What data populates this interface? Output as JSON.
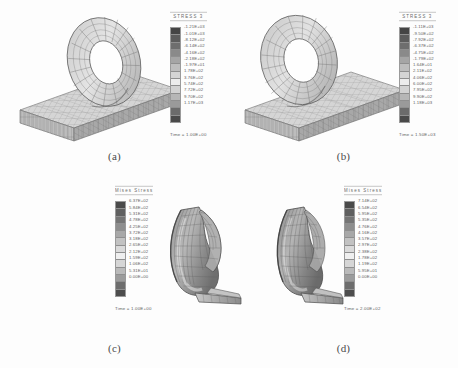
{
  "figure": {
    "panels": [
      {
        "id": "a",
        "caption": "(a)",
        "legend_title": "STRESS 3",
        "time_label": "Time = 1.00E+00",
        "labels": [
          "-1.21E+03",
          "-1.01E+03",
          "-8.12E+02",
          "-6.14E+02",
          "-4.16E+02",
          "-2.18E+02",
          "-1.97E+01",
          "1.78E+02",
          "3.76E+02",
          "5.74E+02",
          "7.72E+02",
          "9.70E+02",
          "1.17E+03"
        ],
        "swatches": [
          "#454545",
          "#5c5c5c",
          "#6e6e6e",
          "#8a8a8a",
          "#a5a5a5",
          "#bdbdbd",
          "#d4d4d4",
          "#ececec",
          "#d2d2d2",
          "#b6b6b6",
          "#9a9a9a",
          "#6b6b6b",
          "#4a4a4a"
        ]
      },
      {
        "id": "b",
        "caption": "(b)",
        "legend_title": "STRESS 3",
        "time_label": "Time = 1.50E+03",
        "labels": [
          "-1.11E+03",
          "-9.50E+02",
          "-7.92E+02",
          "-6.37E+02",
          "-4.75E+02",
          "-1.79E+02",
          "1.64E+01",
          "2.11E+02",
          "4.06E+02",
          "6.00E+02",
          "7.95E+02",
          "9.90E+02",
          "1.18E+03"
        ],
        "swatches": [
          "#454545",
          "#5c5c5c",
          "#6e6e6e",
          "#8a8a8a",
          "#a5a5a5",
          "#bdbdbd",
          "#d4d4d4",
          "#ececec",
          "#d2d2d2",
          "#b6b6b6",
          "#9a9a9a",
          "#6b6b6b",
          "#4a4a4a"
        ]
      },
      {
        "id": "c",
        "caption": "(c)",
        "legend_title": "Mises  Stress",
        "time_label": "Time = 1.00E+00",
        "labels": [
          "6.37E+02",
          "5.84E+02",
          "5.31E+02",
          "4.78E+02",
          "4.25E+02",
          "3.72E+02",
          "3.18E+02",
          "2.65E+02",
          "2.12E+02",
          "1.59E+02",
          "1.06E+02",
          "5.31E+01",
          "0.00E+00"
        ],
        "swatches": [
          "#4a4a4a",
          "#606060",
          "#757575",
          "#8e8e8e",
          "#a8a8a8",
          "#c2c2c2",
          "#dadada",
          "#efefef",
          "#d6d6d6",
          "#bababa",
          "#9c9c9c",
          "#6d6d6d",
          "#4d4d4d"
        ]
      },
      {
        "id": "d",
        "caption": "(d)",
        "legend_title": "Mises  Stress",
        "time_label": "Time = 2.00E+02",
        "labels": [
          "7.14E+02",
          "6.54E+02",
          "5.95E+02",
          "5.35E+02",
          "4.76E+02",
          "4.16E+02",
          "3.57E+02",
          "2.97E+02",
          "2.38E+02",
          "1.78E+02",
          "1.19E+02",
          "5.95E+01",
          "0.00E+00"
        ],
        "swatches": [
          "#4a4a4a",
          "#606060",
          "#757575",
          "#8e8e8e",
          "#a8a8a8",
          "#c2c2c2",
          "#dadada",
          "#efefef",
          "#d6d6d6",
          "#bababa",
          "#9c9c9c",
          "#6d6d6d",
          "#4d4d4d"
        ]
      }
    ],
    "colors": {
      "mesh_line": "#5a5a5a",
      "mesh_fill_light": "#dcdcdc",
      "mesh_fill_mid": "#bbbbbb",
      "mesh_fill_dark": "#8d8d8d",
      "background": "#ffffff",
      "text": "#4a4a4a"
    }
  }
}
